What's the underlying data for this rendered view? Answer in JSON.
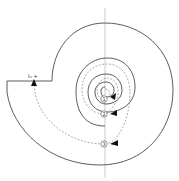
{
  "diagram": {
    "title": "",
    "top_label": "t₁ +",
    "steps": [
      {
        "label": "1",
        "x": 104,
        "y": 99
      },
      {
        "label": "2",
        "x": 104,
        "y": 114
      },
      {
        "label": "3",
        "x": 104,
        "y": 144
      }
    ],
    "colors": {
      "stroke": "#333333",
      "dashed": "#777777",
      "axis": "#aaaaaa",
      "background": "#ffffff"
    }
  }
}
